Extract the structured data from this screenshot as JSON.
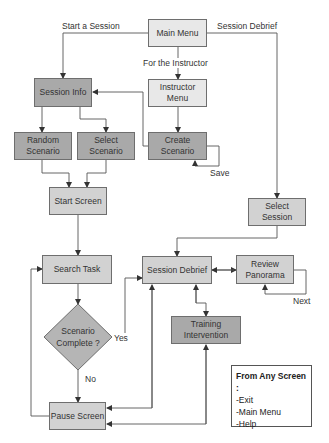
{
  "nodes": {
    "main_menu": "Main Menu",
    "instructor_menu": [
      "Instructor",
      "Menu"
    ],
    "session_info": "Session Info",
    "random_scenario": [
      "Random",
      "Scenario"
    ],
    "select_scenario": [
      "Select",
      "Scenario"
    ],
    "create_scenario": [
      "Create",
      "Scenario"
    ],
    "start_screen": "Start Screen",
    "select_session": [
      "Select",
      "Session"
    ],
    "search_task": "Search Task",
    "session_debrief": "Session Debrief",
    "review_panorama": [
      "Review",
      "Panorama"
    ],
    "scenario_complete": [
      "Scenario",
      "Complete ?"
    ],
    "training_intervention": [
      "Training",
      "Intervention"
    ],
    "pause_screen": "Pause Screen"
  },
  "edge_labels": {
    "start_session": "Start a Session",
    "session_debrief": "Session Debrief",
    "for_instructor": "For the Instructor",
    "save": "Save",
    "next": "Next",
    "yes": "Yes",
    "no": "No"
  },
  "note": {
    "title": "From Any Screen :",
    "items": [
      "-Exit",
      "-Main Menu",
      "-Help"
    ]
  },
  "colors": {
    "light_box": "#e8e8e8",
    "mid_box": "#d2d2d2",
    "dark_box": "#a9a9a9",
    "line": "#444444"
  }
}
